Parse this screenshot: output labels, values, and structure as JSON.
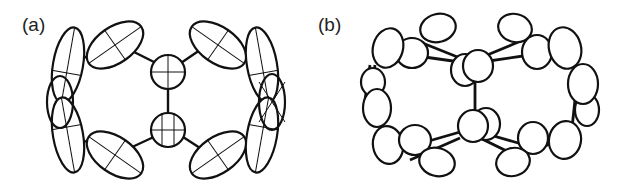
{
  "figure": {
    "panels": [
      {
        "id": "a",
        "label": "(a)",
        "description": "thermal-ellipsoid plot, elongated ellipsoids with principal axes"
      },
      {
        "id": "b",
        "label": "(b)",
        "description": "thermal-ellipsoid plot, alternative view with plain ellipses"
      }
    ]
  }
}
